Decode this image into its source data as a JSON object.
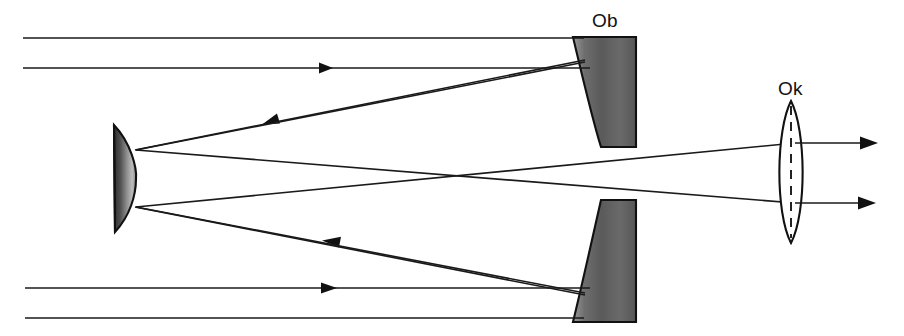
{
  "diagram": {
    "type": "optical-ray-diagram",
    "width": 904,
    "height": 336,
    "background_color": "#ffffff",
    "line_color": "#1a1a1a",
    "optic_fill_dark": "#4a4a4a",
    "optic_fill_light": "#d8d8d8"
  },
  "labels": {
    "objective": "Ob",
    "eyepiece": "Ok"
  },
  "components": {
    "primary_mirror_upper": {
      "name": "Ob",
      "role": "objective-primary-mirror-upper-segment",
      "x_left": 573,
      "x_right": 636,
      "y_top": 37,
      "y_bottom": 147
    },
    "primary_mirror_lower": {
      "name": "Ob",
      "role": "objective-primary-mirror-lower-segment",
      "x_left": 573,
      "x_right": 636,
      "y_top": 200,
      "y_bottom": 322
    },
    "secondary_mirror": {
      "role": "convex-secondary-mirror",
      "x_flat": 114,
      "x_apex": 136,
      "y_top": 125,
      "y_bottom": 232
    },
    "eyepiece_lens": {
      "name": "Ok",
      "role": "biconvex-eyepiece-lens",
      "x_left": 776,
      "x_right": 806,
      "y_top": 101,
      "y_bottom": 243,
      "optical_axis": "dashed-vertical"
    }
  },
  "rays": {
    "incoming_parallel": [
      {
        "id": "in-1",
        "x_start": 23,
        "x_end": 584,
        "y": 38,
        "arrow": false
      },
      {
        "id": "in-2",
        "x_start": 23,
        "x_end": 590,
        "y": 68,
        "arrow": true,
        "arrow_x": 332,
        "direction": "right"
      },
      {
        "id": "in-3",
        "x_start": 25,
        "x_end": 590,
        "y": 288,
        "arrow": true,
        "arrow_x": 336,
        "direction": "right"
      },
      {
        "id": "in-4",
        "x_start": 25,
        "x_end": 584,
        "y": 318,
        "arrow": false
      }
    ],
    "reflected_to_secondary": [
      {
        "id": "refl-upper",
        "x_start": 584,
        "y_start": 62,
        "x_end": 135,
        "y_end": 150,
        "arrow": true,
        "arrow_x": 272,
        "direction": "left"
      },
      {
        "id": "refl-lower",
        "x_start": 584,
        "y_start": 294,
        "x_end": 135,
        "y_end": 207,
        "arrow": true,
        "arrow_x": 338,
        "direction": "left"
      }
    ],
    "secondary_to_eyepiece": [
      {
        "id": "cross-upper",
        "x_start": 136,
        "y_start": 150,
        "x_end": 790,
        "y_end": 203
      },
      {
        "id": "cross-lower",
        "x_start": 136,
        "y_start": 207,
        "x_end": 790,
        "y_end": 143
      }
    ],
    "crossing_point": {
      "x": 455,
      "y": 178
    },
    "outgoing_parallel": [
      {
        "id": "out-1",
        "x_start": 795,
        "x_end": 877,
        "y": 143,
        "arrow": true,
        "direction": "right"
      },
      {
        "id": "out-2",
        "x_start": 795,
        "x_end": 875,
        "y": 203,
        "arrow": true,
        "direction": "right"
      }
    ]
  }
}
